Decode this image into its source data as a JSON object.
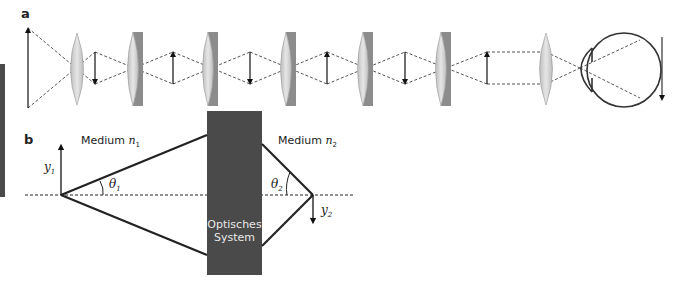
{
  "panels": {
    "a": {
      "label": "a"
    },
    "b": {
      "label": "b"
    }
  },
  "panel_b": {
    "medium_left": {
      "text": "Medium ",
      "symbol": "n",
      "subscript": "1"
    },
    "medium_right": {
      "text": "Medium ",
      "symbol": "n",
      "subscript": "2"
    },
    "object_height": {
      "symbol": "y",
      "subscript": "1"
    },
    "image_height": {
      "symbol": "y",
      "subscript": "2"
    },
    "angle_left": {
      "symbol": "θ",
      "subscript": "1"
    },
    "angle_right": {
      "symbol": "θ",
      "subscript": "2"
    },
    "system_label_line1": "Optisches",
    "system_label_line2": "System"
  },
  "colors": {
    "system_box": "#4a4a4a",
    "left_bar": "#4a4a4a",
    "lens_fill": "#cfcfcf",
    "lens_edge": "#8a8a8a",
    "line": "#222222"
  },
  "icons": {
    "lenses": [
      "biconvex-lens",
      "plano-convex-lens",
      "plano-convex-lens",
      "plano-convex-lens",
      "plano-convex-lens",
      "plano-convex-lens",
      "biconvex-lens"
    ],
    "arrows": [
      "object-arrow-up",
      "image-arrow-down",
      "image-arrow-up",
      "image-arrow-down",
      "image-arrow-up",
      "image-arrow-down",
      "image-arrow-up",
      "retina-arrow-down"
    ],
    "eye": "eye-icon"
  }
}
